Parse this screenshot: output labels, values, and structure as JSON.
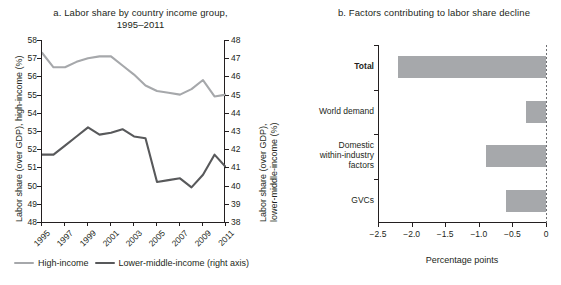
{
  "panel_a": {
    "title": "a. Labor share by country income group, 1995–2011",
    "title_line1": "a. Labor share by country income group,",
    "title_line2": "1995–2011",
    "y_left_label": "Labor share (over GDP), high-income (%)",
    "y_right_label_line1": "Labor share (over GDP),",
    "y_right_label_line2": "lower-middle-income (%)",
    "y_left_ticks": [
      "58",
      "57",
      "56",
      "55",
      "54",
      "53",
      "52",
      "51",
      "50",
      "49",
      "48"
    ],
    "y_right_ticks": [
      "48",
      "47",
      "46",
      "45",
      "44",
      "43",
      "42",
      "41",
      "40",
      "39",
      "38"
    ],
    "x_ticks": [
      "1995",
      "1997",
      "1999",
      "2001",
      "2003",
      "2005",
      "2007",
      "2009",
      "2011"
    ],
    "legend": [
      {
        "label": "High-income",
        "color": "#a6a8ab"
      },
      {
        "label": "Lower-middle-income (right axis)",
        "color": "#58595b"
      }
    ]
  },
  "panel_b": {
    "title": "b. Factors contributing to labor share decline",
    "x_title": "Percentage points",
    "x_ticks": [
      "-2.5",
      "-2.0",
      "-1.5",
      "-1.0",
      "-0.5",
      "0"
    ],
    "bar_color": "#a6a8ab"
  },
  "chart_data": [
    {
      "type": "line",
      "panel": "a",
      "title": "a. Labor share by country income group, 1995–2011",
      "xlabel": "",
      "ylabel": "Labor share (over GDP), high-income (%)",
      "y2label": "Labor share (over GDP), lower-middle-income (%)",
      "x": [
        1995,
        1996,
        1997,
        1998,
        1999,
        2000,
        2001,
        2002,
        2003,
        2004,
        2005,
        2006,
        2007,
        2008,
        2009,
        2010,
        2011
      ],
      "xtick_labels": [
        "1995",
        "1997",
        "1999",
        "2001",
        "2003",
        "2005",
        "2007",
        "2009",
        "2011"
      ],
      "ylim": [
        48,
        58
      ],
      "y2lim": [
        38,
        48
      ],
      "grid": false,
      "legend_position": "bottom",
      "series": [
        {
          "name": "High-income",
          "axis": "left",
          "color": "#a6a8ab",
          "values": [
            57.3,
            56.5,
            56.5,
            56.8,
            57.0,
            57.1,
            57.1,
            56.6,
            56.1,
            55.5,
            55.2,
            55.1,
            55.0,
            55.3,
            55.8,
            54.9,
            55.0
          ]
        },
        {
          "name": "Lower-middle-income (right axis)",
          "axis": "right",
          "color": "#58595b",
          "values": [
            41.7,
            41.7,
            42.2,
            42.7,
            43.2,
            42.8,
            42.9,
            43.1,
            42.7,
            42.6,
            40.2,
            40.3,
            40.4,
            39.9,
            40.6,
            41.7,
            41.0
          ]
        }
      ]
    },
    {
      "type": "bar",
      "panel": "b",
      "orientation": "horizontal",
      "title": "b. Factors contributing to labor share decline",
      "xlabel": "Percentage points",
      "ylabel": "",
      "xlim": [
        -2.5,
        0
      ],
      "xtick_labels": [
        "-2.5",
        "-2.0",
        "-1.5",
        "-1.0",
        "-0.5",
        "0"
      ],
      "xticks": [
        -2.5,
        -2.0,
        -1.5,
        -1.0,
        -0.5,
        0
      ],
      "grid": false,
      "bar_color": "#a6a8ab",
      "categories": [
        {
          "label": "Total",
          "label_lines": [
            "Total"
          ],
          "bold": true,
          "value": -2.2
        },
        {
          "label": "World demand",
          "label_lines": [
            "World demand"
          ],
          "bold": false,
          "value": -0.3
        },
        {
          "label": "Domestic within-industry factors",
          "label_lines": [
            "Domestic",
            "within-industry",
            "factors"
          ],
          "bold": false,
          "value": -0.9
        },
        {
          "label": "GVCs",
          "label_lines": [
            "GVCs"
          ],
          "bold": false,
          "value": -0.6
        }
      ],
      "values": [
        -2.2,
        -0.3,
        -0.9,
        -0.6
      ]
    }
  ]
}
